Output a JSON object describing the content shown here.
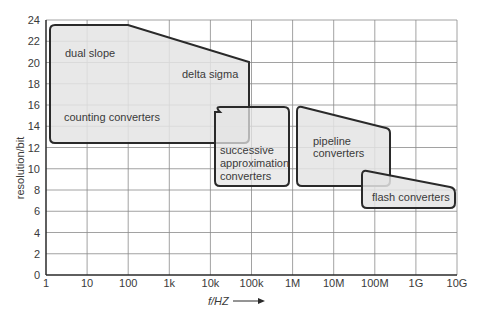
{
  "chart_data": {
    "type": "area",
    "title": "",
    "xlabel": "f/HZ",
    "ylabel": "resolution/bit",
    "x_scale": "log",
    "x_ticks": [
      "1",
      "10",
      "100",
      "1k",
      "10k",
      "100k",
      "1M",
      "10M",
      "100M",
      "1G",
      "10G"
    ],
    "x_tick_values": [
      1,
      10,
      100,
      1000,
      10000,
      100000,
      1000000,
      10000000,
      100000000,
      1000000000,
      10000000000
    ],
    "y_ticks": [
      "0",
      "2",
      "4",
      "6",
      "8",
      "10",
      "12",
      "14",
      "16",
      "18",
      "20",
      "22",
      "24"
    ],
    "ylim": [
      0,
      24
    ],
    "xlim": [
      1,
      10000000000
    ],
    "grid": true,
    "legend": "none",
    "regions": [
      {
        "name": "dual slope / delta sigma / counting converters",
        "labels": [
          "dual slope",
          "delta sigma",
          "counting converters"
        ],
        "polygon_log10f_bits": [
          [
            0.1,
            23.5
          ],
          [
            2.0,
            23.5
          ],
          [
            4.9,
            20.2
          ],
          [
            4.9,
            12.3
          ],
          [
            0.1,
            12.3
          ]
        ]
      },
      {
        "name": "successive approximation converters",
        "labels": [
          "successive",
          "approximation",
          "converters"
        ],
        "polygon_log10f_bits": [
          [
            4.0,
            15.8
          ],
          [
            5.8,
            15.8
          ],
          [
            5.8,
            8.3
          ],
          [
            4.0,
            8.3
          ]
        ]
      },
      {
        "name": "pipeline converters",
        "labels": [
          "pipeline",
          "converters"
        ],
        "polygon_log10f_bits": [
          [
            6.1,
            15.8
          ],
          [
            8.0,
            13.6
          ],
          [
            8.0,
            8.3
          ],
          [
            6.1,
            8.3
          ]
        ]
      },
      {
        "name": "flash converters",
        "labels": [
          "flash converters"
        ],
        "polygon_log10f_bits": [
          [
            7.6,
            9.6
          ],
          [
            9.9,
            8.1
          ],
          [
            9.9,
            6.3
          ],
          [
            7.6,
            6.3
          ]
        ]
      }
    ]
  },
  "axis": {
    "ylabel": "resolution/bit",
    "xlabel": "f/HZ",
    "arrow": "right-arrow"
  },
  "labels": {
    "dual_slope": "dual slope",
    "delta_sigma": "delta sigma",
    "counting": "counting converters",
    "sa_1": "successive",
    "sa_2": "approximation",
    "sa_3": "converters",
    "pipe_1": "pipeline",
    "pipe_2": "converters",
    "flash": "flash converters"
  },
  "colors": {
    "fill": "#e4e4e4",
    "stroke": "#2a2a2a",
    "grid": "#8a8a8a",
    "text": "#3a3a3a"
  }
}
